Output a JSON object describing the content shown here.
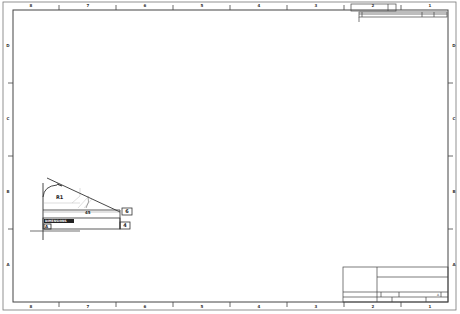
{
  "sheet": {
    "type": "engineering-drawing-sheet",
    "colors": {
      "line": "#444444",
      "border": "#666666",
      "background": "#ffffff",
      "construction": "#c8c8c8"
    }
  },
  "zones": {
    "top": [
      "8",
      "7",
      "6",
      "5",
      "4",
      "3",
      "2",
      "1"
    ],
    "bottom": [
      "8",
      "7",
      "6",
      "5",
      "4",
      "3",
      "2",
      "1"
    ],
    "left": [
      "D",
      "C",
      "B",
      "A"
    ],
    "right": [
      "D",
      "C",
      "B",
      "A"
    ]
  },
  "drawing": {
    "datum_label": "A",
    "fillet_label": "R1",
    "angle_label": "45",
    "note_label": "DIMENSIONS",
    "frame_label_1": "6",
    "frame_label_2": "4"
  },
  "title_block": {
    "sheet_label": "A"
  }
}
